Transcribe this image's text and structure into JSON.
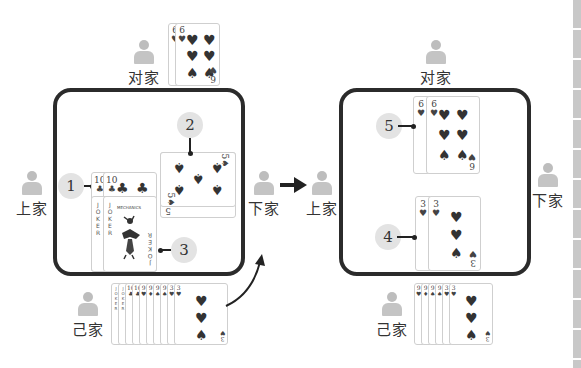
{
  "players": {
    "top": "对家",
    "left": "上家",
    "right": "下家",
    "bottom": "己家"
  },
  "left_panel": {
    "opponent_top_cards": [
      {
        "rank": "6",
        "suit": "♥"
      },
      {
        "rank": "6",
        "suit": "♥"
      }
    ],
    "played_left": {
      "badge": "1",
      "cards": [
        {
          "rank": "10",
          "suit": "♣"
        },
        {
          "rank": "10",
          "suit": "♣"
        }
      ]
    },
    "played_right": {
      "badge": "2",
      "cards": [
        {
          "rank": "5",
          "suit": "♠"
        },
        {
          "rank": "5",
          "suit": "♠"
        }
      ]
    },
    "jokers": {
      "badge": "3",
      "cards": [
        {
          "rank": "JOKER"
        },
        {
          "rank": "JOKER"
        }
      ],
      "caption": "MECHANICS"
    },
    "hand": [
      {
        "rank": "JOKER"
      },
      {
        "rank": "JOKER"
      },
      {
        "rank": "10",
        "suit": "♣"
      },
      {
        "rank": "10",
        "suit": "♣"
      },
      {
        "rank": "9",
        "suit": "♥"
      },
      {
        "rank": "9",
        "suit": "♦"
      },
      {
        "rank": "9",
        "suit": "♠"
      },
      {
        "rank": "9",
        "suit": "♠"
      },
      {
        "rank": "3",
        "suit": "♥"
      },
      {
        "rank": "3",
        "suit": "♥"
      }
    ]
  },
  "right_panel": {
    "top_play": {
      "badge": "5",
      "cards": [
        {
          "rank": "6",
          "suit": "♥"
        },
        {
          "rank": "6",
          "suit": "♥"
        }
      ]
    },
    "bottom_play": {
      "badge": "4",
      "cards": [
        {
          "rank": "3",
          "suit": "♥"
        },
        {
          "rank": "3",
          "suit": "♥"
        }
      ]
    },
    "hand": [
      {
        "rank": "9",
        "suit": "♥"
      },
      {
        "rank": "9",
        "suit": "♦"
      },
      {
        "rank": "9",
        "suit": "♠"
      },
      {
        "rank": "9",
        "suit": "♠"
      },
      {
        "rank": "3",
        "suit": "♥"
      },
      {
        "rank": "3",
        "suit": "♥"
      }
    ]
  },
  "glyphs": {
    "heart": "♥",
    "spade": "♠",
    "club": "♣"
  }
}
